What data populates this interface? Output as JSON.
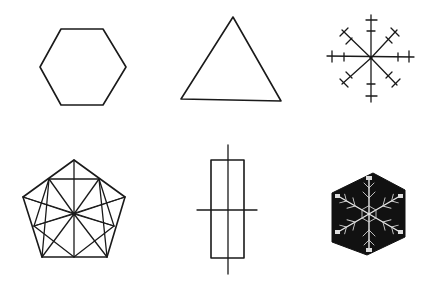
{
  "figure": {
    "background": "#ffffff",
    "ink_color": "#1a1a1a",
    "layout": "2 rows x 3 columns of symbols",
    "symbols": [
      {
        "row": 1,
        "col": 1,
        "name": "hexagon",
        "icon": "hexagon-outline-icon"
      },
      {
        "row": 1,
        "col": 2,
        "name": "triangle",
        "icon": "triangle-outline-icon"
      },
      {
        "row": 1,
        "col": 3,
        "name": "eight-armed cross with ticks",
        "icon": "asterisk-ticks-icon"
      },
      {
        "row": 2,
        "col": 1,
        "name": "pentagon with radial subdivisions",
        "icon": "pentagon-star-icon"
      },
      {
        "row": 2,
        "col": 2,
        "name": "rectangle with crossing lines",
        "icon": "rectangle-cross-icon"
      },
      {
        "row": 2,
        "col": 3,
        "name": "snowflake photograph in dark hexagon",
        "icon": "snowflake-icon"
      }
    ],
    "snowflake_fill": "#111111",
    "snowflake_crystal": "#e8e8e8"
  }
}
